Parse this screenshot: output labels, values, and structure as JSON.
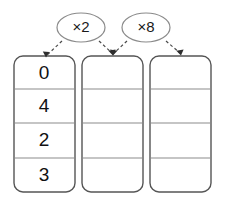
{
  "diagram": {
    "canvas": {
      "width": 227,
      "height": 200,
      "background": "#ffffff"
    },
    "operators": [
      {
        "id": "op1",
        "label": "×2",
        "name": "multiply-by-2-bubble"
      },
      {
        "id": "op2",
        "label": "×8",
        "name": "multiply-by-8-bubble"
      }
    ],
    "columns": [
      {
        "id": "col1",
        "name": "input-column",
        "cells": [
          "0",
          "4",
          "2",
          "3"
        ]
      },
      {
        "id": "col2",
        "name": "first-product-column",
        "cells": [
          "",
          "",
          "",
          ""
        ]
      },
      {
        "id": "col3",
        "name": "second-product-column",
        "cells": [
          "",
          "",
          "",
          ""
        ]
      }
    ],
    "arrows": [
      {
        "id": "a1",
        "from": "op1",
        "to": "col1",
        "style": "dashed"
      },
      {
        "id": "a2",
        "from": "op1",
        "to": "col2",
        "style": "dashed"
      },
      {
        "id": "a3",
        "from": "op2",
        "to": "col2",
        "style": "dashed"
      },
      {
        "id": "a4",
        "from": "op2",
        "to": "col3",
        "style": "dashed"
      }
    ],
    "colors": {
      "box_stroke": "#555555",
      "row_line": "#8c8c8c",
      "bubble_stroke": "#8a8a8a",
      "arrow": "#4a4a4a",
      "text": "#111111"
    }
  }
}
